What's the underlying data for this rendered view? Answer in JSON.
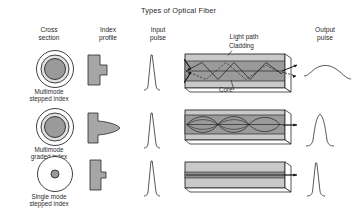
{
  "title": "Types of Optical Fiber",
  "columns": [
    {
      "id": "cross-section",
      "line1": "Cross",
      "line2": "section"
    },
    {
      "id": "index-profile",
      "line1": "Index",
      "line2": "profile"
    },
    {
      "id": "input-pulse",
      "line1": "Input",
      "line2": "pulse"
    },
    {
      "id": "light-path",
      "line1": "Light path",
      "line2": ""
    },
    {
      "id": "output-pulse",
      "line1": "Output",
      "line2": "pulse"
    }
  ],
  "rows": [
    {
      "id": "multimode-stepped-index",
      "label_line1": "Multimode",
      "label_line2": "stepped index",
      "cross_section": {
        "core_style": "large-uniform",
        "cladding_rings": 2
      },
      "index_profile": {
        "shape": "step",
        "description": "rectangular step profile"
      },
      "input_pulse": {
        "shape": "narrow-spike",
        "width": "narrow"
      },
      "light_path": {
        "rays": "zig-zag multiple reflections",
        "dispersion": "high"
      },
      "output_pulse": {
        "shape": "broad-flat",
        "width": "very-wide"
      }
    },
    {
      "id": "multimode-graded-index",
      "label_line1": "Multimode",
      "label_line2": "graded index",
      "cross_section": {
        "core_style": "large-graded",
        "cladding_rings": 2
      },
      "index_profile": {
        "shape": "graded-triangle",
        "description": "parabolic graded profile"
      },
      "input_pulse": {
        "shape": "narrow-spike",
        "width": "narrow"
      },
      "light_path": {
        "rays": "sinusoidal curved paths",
        "dispersion": "medium"
      },
      "output_pulse": {
        "shape": "rounded-peak",
        "width": "medium"
      }
    },
    {
      "id": "single-mode-stepped-index",
      "label_line1": "Single mode",
      "label_line2": "stepped index",
      "cross_section": {
        "core_style": "small-uniform",
        "cladding_rings": 1
      },
      "index_profile": {
        "shape": "narrow-step",
        "description": "narrow rectangular step profile"
      },
      "input_pulse": {
        "shape": "narrow-spike",
        "width": "narrow"
      },
      "light_path": {
        "rays": "straight axial path",
        "dispersion": "low"
      },
      "output_pulse": {
        "shape": "narrow-spike",
        "width": "narrow"
      }
    }
  ],
  "annotations": {
    "cladding": "Cladding",
    "core": "Core"
  },
  "colors": {
    "core_fill": "#9a9a9a",
    "cladding_fill": "#c9c9c9",
    "profile_fill": "#a6a6a6",
    "stroke": "#2a2a2a",
    "background": "#ffffff"
  }
}
